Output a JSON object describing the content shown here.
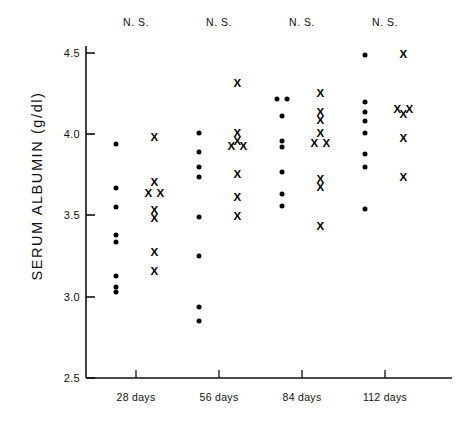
{
  "chart_data": {
    "type": "scatter",
    "title": "",
    "xlabel": "",
    "ylabel": "SERUM  ALBUMIN  (g/dl)",
    "ylim": [
      2.5,
      4.5
    ],
    "yticks": [
      2.5,
      3.0,
      3.5,
      4.0,
      4.5
    ],
    "ytick_labels": [
      "2.5",
      "3.0",
      "3.5",
      "4.0",
      "4.5"
    ],
    "categories": [
      "28 days",
      "56 days",
      "84 days",
      "112 days"
    ],
    "annotations": [
      "N. S.",
      "N. S.",
      "N. S.",
      "N. S."
    ],
    "grid": false,
    "legend": "none",
    "series": [
      {
        "name": "dots",
        "marker": "filled-circle",
        "groups": [
          {
            "category": "28 days",
            "values": [
              3.94,
              3.67,
              3.55,
              3.38,
              3.34,
              3.13,
              3.06,
              3.03
            ]
          },
          {
            "category": "56 days",
            "values": [
              4.01,
              3.89,
              3.8,
              3.74,
              3.49,
              3.25,
              2.94,
              2.85
            ]
          },
          {
            "category": "84 days",
            "values": [
              4.22,
              4.22,
              4.11,
              3.96,
              3.92,
              3.77,
              3.63,
              3.56
            ]
          },
          {
            "category": "112 days",
            "values": [
              4.49,
              4.2,
              4.14,
              4.08,
              4.01,
              3.88,
              3.8,
              3.54
            ]
          }
        ]
      },
      {
        "name": "crosses",
        "marker": "x",
        "groups": [
          {
            "category": "28 days",
            "values": [
              3.98,
              3.7,
              3.63,
              3.63,
              3.53,
              3.48,
              3.27,
              3.15
            ]
          },
          {
            "category": "56 days",
            "values": [
              4.31,
              4.0,
              3.95,
              3.92,
              3.92,
              3.75,
              3.61,
              3.49
            ]
          },
          {
            "category": "84 days",
            "values": [
              4.25,
              4.13,
              4.08,
              4.0,
              3.94,
              3.94,
              3.72,
              3.67,
              3.43
            ]
          },
          {
            "category": "112 days",
            "values": [
              4.49,
              4.15,
              4.15,
              4.12,
              3.97,
              3.73
            ]
          }
        ]
      }
    ],
    "group_offsets": {
      "dots": -0.24,
      "crosses": 0.22
    }
  }
}
